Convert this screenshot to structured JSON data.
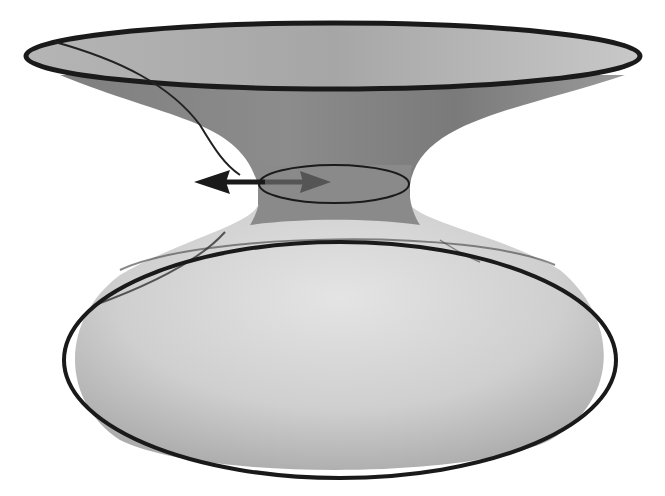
{
  "figure": {
    "colors": {
      "background": "#ffffff",
      "outline": "#1a1a1a",
      "upper_surface_light": "#bdbdbd",
      "upper_surface_dark": "#7a7a7a",
      "throat": "#8a8a8a",
      "lower_surface_light": "#dcdcdc",
      "lower_surface_dark": "#9a9a9a",
      "arrow_front": "#1a1a1a",
      "arrow_behind": "#5a5a5a"
    },
    "elements": [
      {
        "name": "upper-rim",
        "type": "ellipse"
      },
      {
        "name": "throat-ring",
        "type": "ellipse"
      },
      {
        "name": "lower-rim",
        "type": "ellipse"
      },
      {
        "name": "geodesic-line",
        "type": "curve"
      },
      {
        "name": "double-arrow",
        "type": "arrow"
      }
    ]
  }
}
